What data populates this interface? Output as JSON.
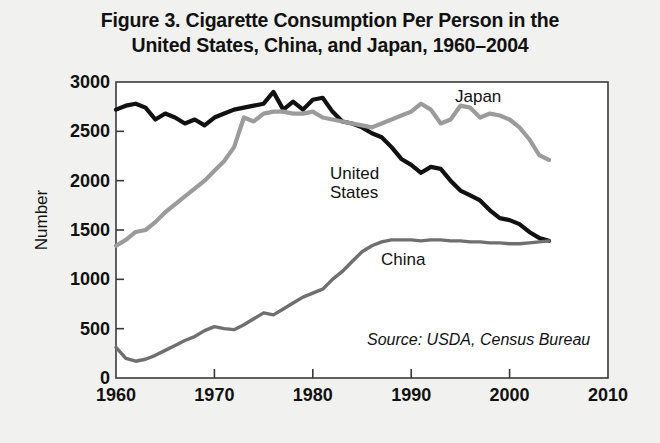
{
  "figure": {
    "title_line1": "Figure 3. Cigarette Consumption Per Person in the",
    "title_line2": "United States, China, and Japan, 1960–2004",
    "source_note": "Source: USDA, Census Bureau",
    "background_color": "#f1f1ef",
    "plot_background_color": "#ffffff",
    "axis_color": "#3a3a3a"
  },
  "labels": {
    "japan": "Japan",
    "united_states": "United\nStates",
    "china": "China",
    "ylabel": "Number"
  },
  "chart_data": {
    "type": "line",
    "title": "Figure 3. Cigarette Consumption Per Person in the United States, China, and Japan, 1960–2004",
    "xlabel": "",
    "ylabel": "Number",
    "xlim": [
      1960,
      2010
    ],
    "ylim": [
      0,
      3000
    ],
    "xticks": [
      1960,
      1970,
      1980,
      1990,
      2000,
      2010
    ],
    "yticks": [
      0,
      500,
      1000,
      1500,
      2000,
      2500,
      3000
    ],
    "grid": false,
    "legend_position": "inline-annotations",
    "annotations": [
      {
        "text": "Japan",
        "x": 1996,
        "y": 2880
      },
      {
        "text": "United States",
        "x": 1986,
        "y": 2020
      },
      {
        "text": "China",
        "x": 1991,
        "y": 1230
      },
      {
        "text": "Source: USDA, Census Bureau",
        "x": 1993,
        "y": 330
      }
    ],
    "series": [
      {
        "name": "United States",
        "color": "#111111",
        "linewidth": 4.2,
        "x": [
          1960,
          1961,
          1962,
          1963,
          1964,
          1965,
          1966,
          1967,
          1968,
          1969,
          1970,
          1971,
          1972,
          1973,
          1974,
          1975,
          1976,
          1977,
          1978,
          1979,
          1980,
          1981,
          1982,
          1983,
          1984,
          1985,
          1986,
          1987,
          1988,
          1989,
          1990,
          1991,
          1992,
          1993,
          1994,
          1995,
          1996,
          1997,
          1998,
          1999,
          2000,
          2001,
          2002,
          2003,
          2004
        ],
        "y": [
          2720,
          2760,
          2780,
          2740,
          2620,
          2680,
          2640,
          2580,
          2620,
          2560,
          2640,
          2680,
          2720,
          2740,
          2760,
          2780,
          2900,
          2720,
          2800,
          2720,
          2820,
          2840,
          2700,
          2600,
          2580,
          2540,
          2480,
          2440,
          2340,
          2220,
          2160,
          2080,
          2140,
          2120,
          2000,
          1900,
          1850,
          1800,
          1700,
          1620,
          1600,
          1560,
          1480,
          1420,
          1390
        ]
      },
      {
        "name": "Japan",
        "color": "#9b9b9b",
        "linewidth": 4.2,
        "x": [
          1960,
          1961,
          1962,
          1963,
          1964,
          1965,
          1966,
          1967,
          1968,
          1969,
          1970,
          1971,
          1972,
          1973,
          1974,
          1975,
          1976,
          1977,
          1978,
          1979,
          1980,
          1981,
          1982,
          1983,
          1984,
          1985,
          1986,
          1987,
          1988,
          1989,
          1990,
          1991,
          1992,
          1993,
          1994,
          1995,
          1996,
          1997,
          1998,
          1999,
          2000,
          2001,
          2002,
          2003,
          2004
        ],
        "y": [
          1340,
          1400,
          1480,
          1500,
          1580,
          1680,
          1760,
          1840,
          1920,
          2000,
          2100,
          2200,
          2340,
          2640,
          2600,
          2680,
          2700,
          2700,
          2680,
          2680,
          2700,
          2640,
          2620,
          2600,
          2580,
          2560,
          2540,
          2580,
          2620,
          2660,
          2700,
          2780,
          2720,
          2580,
          2620,
          2760,
          2740,
          2640,
          2680,
          2660,
          2620,
          2540,
          2420,
          2260,
          2210
        ]
      },
      {
        "name": "China",
        "color": "#6f6f6f",
        "linewidth": 3.4,
        "x": [
          1960,
          1961,
          1962,
          1963,
          1964,
          1965,
          1966,
          1967,
          1968,
          1969,
          1970,
          1971,
          1972,
          1973,
          1974,
          1975,
          1976,
          1977,
          1978,
          1979,
          1980,
          1981,
          1982,
          1983,
          1984,
          1985,
          1986,
          1987,
          1988,
          1989,
          1990,
          1991,
          1992,
          1993,
          1994,
          1995,
          1996,
          1997,
          1998,
          1999,
          2000,
          2001,
          2002,
          2003,
          2004
        ],
        "y": [
          310,
          200,
          170,
          190,
          230,
          280,
          330,
          380,
          420,
          480,
          520,
          500,
          490,
          540,
          600,
          660,
          640,
          700,
          760,
          820,
          860,
          900,
          1000,
          1080,
          1180,
          1280,
          1340,
          1380,
          1400,
          1400,
          1400,
          1390,
          1400,
          1400,
          1390,
          1390,
          1380,
          1380,
          1370,
          1370,
          1360,
          1360,
          1370,
          1380,
          1390
        ]
      }
    ]
  }
}
